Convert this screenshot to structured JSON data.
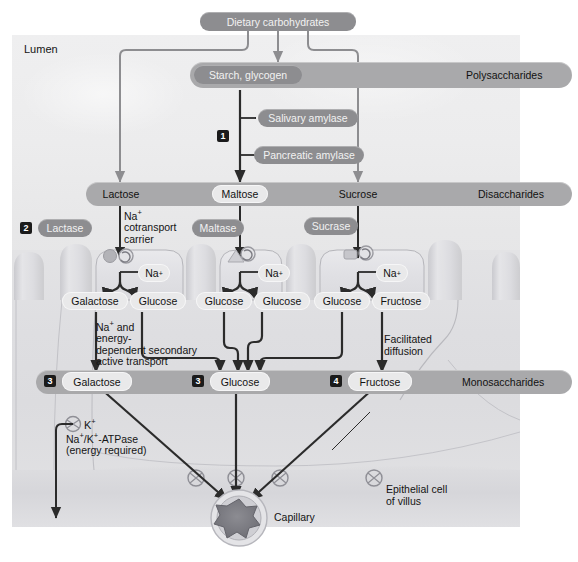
{
  "diagram": {
    "lumen_label": "Lumen",
    "colors": {
      "band": "#a9a9ab",
      "enzyme_pill": "#8d8d90",
      "sugar_pill": "#e9e9ea",
      "badge": "#1b1b1b",
      "arrow": "#2b2b2b",
      "panel_bg": "#ecebec"
    }
  },
  "top": {
    "dietary": "Dietary carbohydrates"
  },
  "bands": [
    {
      "name": "polysaccharides",
      "label": "Polysaccharides",
      "member": "Starch, glycogen"
    },
    {
      "name": "disaccharides",
      "label": "Disaccharides",
      "members": [
        "Lactose",
        "Maltose",
        "Sucrose"
      ]
    },
    {
      "name": "monosaccharides",
      "label": "Monosaccharides",
      "members": [
        "Galactose",
        "Glucose",
        "Fructose"
      ]
    }
  ],
  "enzymes": {
    "salivary_amylase": "Salivary amylase",
    "pancreatic_amylase": "Pancreatic amylase",
    "lactase": "Lactase",
    "maltase": "Maltase",
    "sucrase": "Sucrase"
  },
  "steps": {
    "one": "1",
    "two": "2",
    "three_galactose": "3",
    "three_glucose": "3",
    "four_fructose": "4"
  },
  "annotations": {
    "na_cotransport": "Na⁺\ncotransport\ncarrier",
    "secondary_active": "Na⁺ and\nenergy-\ndependent secondary\nactive transport",
    "facilitated": "Facilitated\ndiffusion",
    "atpase": "Na⁺/K⁺-ATPase\n(energy required)",
    "k_ion": "K⁺",
    "epithelial": "Epithelial cell\nof villus",
    "capillary": "Capillary"
  },
  "ions": {
    "na_lactase": "Na⁺",
    "na_maltase": "Na⁺",
    "na_sucrase": "Na⁺"
  },
  "products": {
    "lactose": [
      "Galactose",
      "Glucose"
    ],
    "maltose": [
      "Glucose",
      "Glucose"
    ],
    "sucrose": [
      "Glucose",
      "Fructose"
    ]
  }
}
